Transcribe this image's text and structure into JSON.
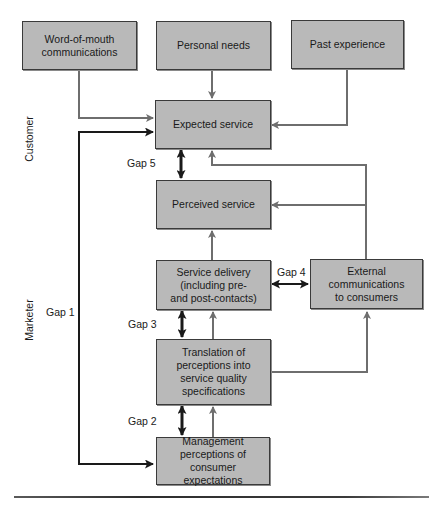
{
  "diagram": {
    "sides": {
      "customer": "Customer",
      "marketer": "Marketer"
    },
    "boxes": {
      "word_of_mouth": "Word-of-mouth\ncommunications",
      "personal_needs": "Personal needs",
      "past_experience": "Past experience",
      "expected_service": "Expected service",
      "perceived_service": "Perceived service",
      "service_delivery": "Service delivery\n(including pre-\nand post-contacts)",
      "external_communications": "External\ncommunications\nto consumers",
      "translation": "Translation of\nperceptions into\nservice quality\nspecifications",
      "management_perceptions": "Management\nperceptions of\nconsumer expectations"
    },
    "gaps": {
      "gap1": "Gap 1",
      "gap2": "Gap 2",
      "gap3": "Gap 3",
      "gap4": "Gap 4",
      "gap5": "Gap 5"
    },
    "colors": {
      "box_fill": "#b9b9b9",
      "box_border": "#3a3a3a",
      "flow_arrow": "#6e6e6e",
      "gap_arrow": "#1a1a1a"
    }
  }
}
